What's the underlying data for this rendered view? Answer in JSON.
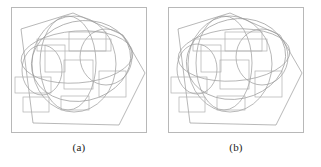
{
  "figure": {
    "background_color": "#ffffff",
    "panel_count": 2,
    "caption_a": "(a)",
    "caption_b": "(b)"
  },
  "style": {
    "panel_border_color": "#b8b8b8",
    "stroke_color": "#9a9a9a",
    "stroke_color_light": "#b0b0b0",
    "stroke_width": "0.7",
    "fill": "none",
    "caption_color": "#222222"
  },
  "panel_a": {
    "label": "(a)",
    "name": "panel-a",
    "viewbox": "0 0 136 126",
    "hexagon": {
      "name": "hexagon-outline",
      "points": "10,22 62,6 112,28 134,66 108,118 22,116"
    },
    "ellipses": [
      {
        "name": "ellipse-large-center",
        "cx": 63,
        "cy": 57,
        "rx": 42,
        "ry": 48,
        "rotate": 0
      },
      {
        "name": "ellipse-wide-horizontal",
        "cx": 66,
        "cy": 50,
        "rx": 56,
        "ry": 26,
        "rotate": -4
      },
      {
        "name": "ellipse-right",
        "cx": 95,
        "cy": 50,
        "rx": 26,
        "ry": 28,
        "rotate": 0
      },
      {
        "name": "ellipse-left-small",
        "cx": 31,
        "cy": 63,
        "rx": 20,
        "ry": 25,
        "rotate": 0
      },
      {
        "name": "ellipse-tall-inner",
        "cx": 57,
        "cy": 56,
        "rx": 28,
        "ry": 47,
        "rotate": 0
      },
      {
        "name": "ellipse-arc-upper",
        "cx": 70,
        "cy": 54,
        "rx": 50,
        "ry": 40,
        "rotate": -12
      }
    ],
    "rectangles": [
      {
        "name": "rect-top-right-wide",
        "x": 58,
        "y": 25,
        "w": 37,
        "h": 19
      },
      {
        "name": "rect-upper-band",
        "x": 26,
        "y": 32,
        "w": 74,
        "h": 12
      },
      {
        "name": "rect-tall-left-center",
        "x": 34,
        "y": 38,
        "w": 20,
        "h": 27
      },
      {
        "name": "rect-center-square",
        "x": 53,
        "y": 53,
        "w": 29,
        "h": 29
      },
      {
        "name": "rect-left-middle",
        "x": 4,
        "y": 70,
        "w": 36,
        "h": 16
      },
      {
        "name": "rect-right-square",
        "x": 88,
        "y": 64,
        "w": 27,
        "h": 26
      },
      {
        "name": "rect-bottom-left",
        "x": 12,
        "y": 90,
        "w": 26,
        "h": 15
      },
      {
        "name": "rect-bottom-center",
        "x": 50,
        "y": 89,
        "w": 28,
        "h": 14
      }
    ]
  },
  "panel_b": {
    "label": "(b)",
    "name": "panel-b",
    "viewbox": "0 0 136 126",
    "hexagon": {
      "name": "hexagon-outline",
      "points": "10,22 62,6 112,28 134,66 108,118 22,116"
    },
    "ellipses": [
      {
        "name": "ellipse-large-center",
        "cx": 62,
        "cy": 57,
        "rx": 42,
        "ry": 48,
        "rotate": 0
      },
      {
        "name": "ellipse-wide-horizontal",
        "cx": 66,
        "cy": 48,
        "rx": 56,
        "ry": 26,
        "rotate": -4
      },
      {
        "name": "ellipse-right",
        "cx": 94,
        "cy": 50,
        "rx": 26,
        "ry": 28,
        "rotate": 0
      },
      {
        "name": "ellipse-left-small",
        "cx": 29,
        "cy": 62,
        "rx": 20,
        "ry": 25,
        "rotate": 0
      },
      {
        "name": "ellipse-tall-inner",
        "cx": 56,
        "cy": 56,
        "rx": 28,
        "ry": 47,
        "rotate": 0
      },
      {
        "name": "ellipse-arc-upper",
        "cx": 68,
        "cy": 52,
        "rx": 50,
        "ry": 40,
        "rotate": -12
      }
    ],
    "rectangles": [
      {
        "name": "rect-top-right-wide",
        "x": 57,
        "y": 25,
        "w": 37,
        "h": 19
      },
      {
        "name": "rect-upper-band",
        "x": 25,
        "y": 32,
        "w": 74,
        "h": 12
      },
      {
        "name": "rect-tall-left-center",
        "x": 33,
        "y": 38,
        "w": 20,
        "h": 27
      },
      {
        "name": "rect-center-square",
        "x": 52,
        "y": 53,
        "w": 29,
        "h": 29
      },
      {
        "name": "rect-left-middle",
        "x": 3,
        "y": 70,
        "w": 36,
        "h": 16
      },
      {
        "name": "rect-right-square",
        "x": 87,
        "y": 64,
        "w": 27,
        "h": 26
      },
      {
        "name": "rect-bottom-left",
        "x": 11,
        "y": 90,
        "w": 26,
        "h": 15
      },
      {
        "name": "rect-bottom-center",
        "x": 49,
        "y": 89,
        "w": 28,
        "h": 14
      }
    ]
  }
}
